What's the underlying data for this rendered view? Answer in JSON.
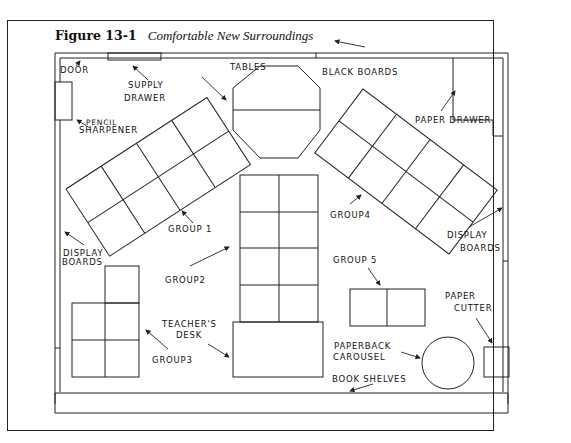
{
  "figure": {
    "number": "Figure 13-1",
    "title": "Comfortable New Surroundings"
  },
  "labels": {
    "door": "DOOR",
    "supply_drawer_1": "SUPPLY",
    "supply_drawer_2": "DRAWER",
    "tables": "TABLES",
    "black_boards": "BLACK BOARDS",
    "paper_drawer": "PAPER DRAWER",
    "pencil_sharpener_1": "PENCIL",
    "pencil_sharpener_2": "SHARPENER",
    "group1": "GROUP 1",
    "group2": "GROUP2",
    "group3": "GROUP3",
    "group4": "GROUP4",
    "group5": "GROUP 5",
    "display_boards_left_1": "DISPLAY",
    "display_boards_left_2": "BOARDS",
    "display_boards_right_1": "DISPLAY",
    "display_boards_right_2": "BOARDS",
    "teachers_desk_1": "TEACHER'S",
    "teachers_desk_2": "DESK",
    "paper_cutter_1": "PAPER",
    "paper_cutter_2": "CUTTER",
    "paperback_carousel_1": "PAPERBACK",
    "paperback_carousel_2": "CAROUSEL",
    "book_shelves": "BOOK SHELVES"
  },
  "colors": {
    "ink": "#222222",
    "background": "#ffffff"
  }
}
